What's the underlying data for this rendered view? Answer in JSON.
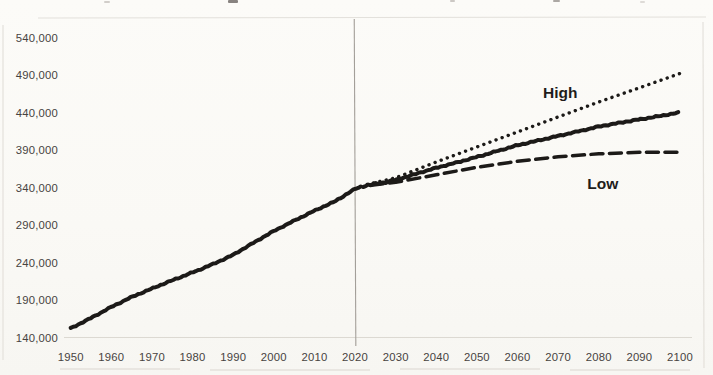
{
  "chart_data": {
    "type": "line",
    "xlabel": "",
    "ylabel": "",
    "xlim": [
      1950,
      2100
    ],
    "ylim": [
      140000,
      540000
    ],
    "grid": "off",
    "legend": "inline-annotations",
    "x_tick_labels": [
      "1950",
      "1960",
      "1970",
      "1980",
      "1990",
      "2000",
      "2010",
      "2020",
      "2030",
      "2040",
      "2050",
      "2060",
      "2070",
      "2080",
      "2090",
      "2100"
    ],
    "y_tick_labels": [
      "540,000",
      "490,000",
      "440,000",
      "390,000",
      "340,000",
      "290,000",
      "240,000",
      "190,000",
      "140,000"
    ],
    "divider_year": 2020,
    "series": [
      {
        "name": "historical",
        "style": "solid",
        "points": [
          [
            1950,
            152000
          ],
          [
            1955,
            166000
          ],
          [
            1960,
            181000
          ],
          [
            1965,
            194000
          ],
          [
            1970,
            205000
          ],
          [
            1975,
            216000
          ],
          [
            1980,
            227000
          ],
          [
            1985,
            238000
          ],
          [
            1990,
            250000
          ],
          [
            1995,
            266000
          ],
          [
            2000,
            282000
          ],
          [
            2005,
            296000
          ],
          [
            2010,
            309000
          ],
          [
            2015,
            321000
          ],
          [
            2020,
            338000
          ],
          [
            2022,
            342000
          ]
        ]
      },
      {
        "name": "high-projection",
        "style": "dotted",
        "points": [
          [
            2023,
            344000
          ],
          [
            2030,
            353000
          ],
          [
            2040,
            374000
          ],
          [
            2050,
            394000
          ],
          [
            2060,
            414000
          ],
          [
            2070,
            434000
          ],
          [
            2080,
            454000
          ],
          [
            2090,
            473000
          ],
          [
            2100,
            492000
          ]
        ]
      },
      {
        "name": "middle-projection",
        "style": "solid",
        "points": [
          [
            2022,
            342000
          ],
          [
            2030,
            350000
          ],
          [
            2040,
            366000
          ],
          [
            2050,
            381000
          ],
          [
            2060,
            396000
          ],
          [
            2070,
            409000
          ],
          [
            2080,
            421000
          ],
          [
            2090,
            431000
          ],
          [
            2100,
            440000
          ]
        ]
      },
      {
        "name": "low-projection",
        "style": "dashed",
        "points": [
          [
            2024,
            343000
          ],
          [
            2030,
            347000
          ],
          [
            2040,
            357000
          ],
          [
            2050,
            367000
          ],
          [
            2060,
            375000
          ],
          [
            2070,
            381000
          ],
          [
            2080,
            385000
          ],
          [
            2090,
            387000
          ],
          [
            2100,
            387000
          ]
        ]
      }
    ],
    "annotations": [
      {
        "text": "High",
        "year": 2070.5,
        "value": 466000
      },
      {
        "text": "Low",
        "year": 2081.0,
        "value": 345000
      }
    ],
    "colors": {
      "line": "#1c1a18",
      "tick_text": "#47433f",
      "annotation_text": "#1f1d1b",
      "divider_line": "#a39f99",
      "background": "#fbfaf7"
    }
  }
}
